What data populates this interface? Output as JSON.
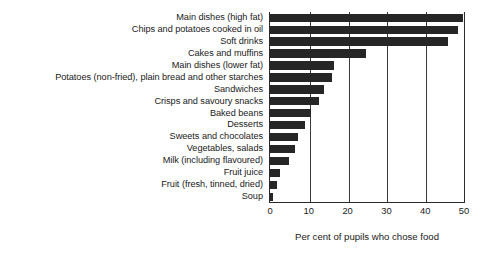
{
  "chart_data": {
    "type": "bar",
    "orientation": "horizontal",
    "title": "",
    "xlabel": "Per cent of pupils who chose food",
    "ylabel": "",
    "xlim": [
      0,
      50
    ],
    "xticks": [
      0,
      10,
      20,
      30,
      40,
      50
    ],
    "xtick_labels": [
      "0",
      "10",
      "20",
      "30",
      "40",
      "50"
    ],
    "grid": "vertical",
    "legend": "none",
    "bar_color": "#262626",
    "axis_color": "#2b2b2b",
    "categories": [
      "Main dishes (high fat)",
      "Chips and potatoes cooked in oil",
      "Soft drinks",
      "Cakes and muffins",
      "Main dishes (lower fat)",
      "Potatoes (non-fried), plain bread and other starches",
      "Sandwiches",
      "Crisps and savoury snacks",
      "Baked beans",
      "Desserts",
      "Sweets and chocolates",
      "Vegetables, salads",
      "Milk (including flavoured)",
      "Fruit juice",
      "Fruit (fresh, tinned, dried)",
      "Soup"
    ],
    "values": [
      49.7,
      48.5,
      46,
      24.7,
      16.6,
      16,
      14,
      12.5,
      10.5,
      9,
      7.3,
      6.5,
      5,
      2.5,
      1.8,
      0.8
    ]
  }
}
